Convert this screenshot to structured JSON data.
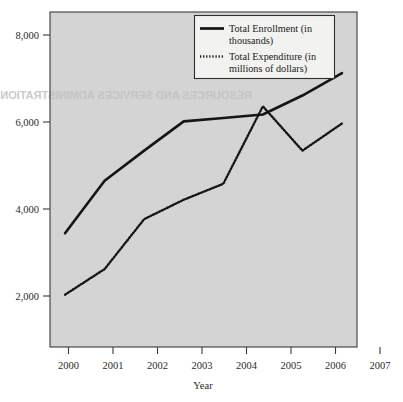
{
  "chart_data": {
    "type": "line",
    "title": "",
    "xlabel": "Year",
    "ylabel": "",
    "categories": [
      "2000",
      "2001",
      "2002",
      "2003",
      "2004",
      "2005",
      "2006",
      "2007"
    ],
    "x": [
      2000,
      2001,
      2002,
      2003,
      2004,
      2005,
      2006,
      2007
    ],
    "xlim": [
      1999.62,
      2007.38
    ],
    "ylim": [
      760,
      8540
    ],
    "yticks": [
      2000,
      4000,
      6000,
      8000
    ],
    "ytick_labels": [
      "2,000",
      "4,000",
      "6,000",
      "8,000"
    ],
    "grid": false,
    "legend_position": "top-right",
    "series": [
      {
        "name": "Total Enrollment (in thousands)",
        "style": "solid",
        "values": [
          3400,
          4620,
          5320,
          6000,
          6080,
          6160,
          6600,
          7120
        ]
      },
      {
        "name": "Total Expenditure (in millions of dollars)",
        "style": "dotted",
        "values": [
          1975,
          2570,
          3730,
          4180,
          4550,
          6350,
          5320,
          5950
        ]
      }
    ]
  },
  "legend": {
    "entries": [
      {
        "line1": "Total Enrollment (in",
        "line2": "thousands)",
        "marker": "solid-line-swatch"
      },
      {
        "line1": "Total Expenditure (in",
        "line2": "millions of dollars)",
        "marker": "dotted-line-swatch"
      }
    ]
  },
  "axes": {
    "x_title": "Year",
    "x_tick_labels": [
      "2000",
      "2001",
      "2002",
      "2003",
      "2004",
      "2005",
      "2006",
      "2007"
    ],
    "y_tick_labels": [
      "2,000",
      "4,000",
      "6,000",
      "8,000"
    ]
  },
  "background": {
    "page_color": "#ffffff",
    "plot_color": "#d4d4d4",
    "line_color": "#151515",
    "bleed_through_text": "RESOURCES AND SERVICES ADMINISTRATION"
  }
}
